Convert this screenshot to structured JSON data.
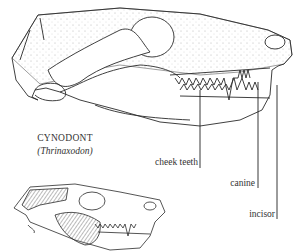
{
  "figure": {
    "title": "CYNODONT",
    "subtitle": "(Thrinaxodon)",
    "labels": {
      "cheek_teeth": "cheek teeth",
      "canine": "canine",
      "incisor": "incisor"
    },
    "colors": {
      "ink": "#2a2a2a",
      "shading": "#8a8a8a",
      "background": "#ffffff"
    }
  }
}
